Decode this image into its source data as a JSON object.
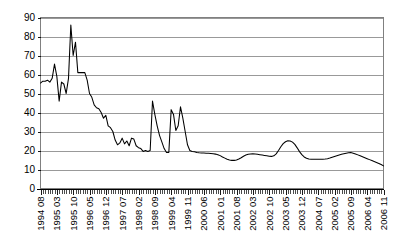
{
  "chart_data": {
    "type": "line",
    "title": "",
    "subtitle": "",
    "xlabel": "",
    "ylabel": "",
    "ylim": [
      0,
      90
    ],
    "ytick_step": 10,
    "ytick_labels": [
      "0",
      "10",
      "20",
      "30",
      "40",
      "50",
      "60",
      "70",
      "80",
      "90"
    ],
    "grid": true,
    "grid_axis": "y",
    "legend": false,
    "legend_position": "none",
    "line_color": "#000000",
    "grid_color": "#808080",
    "background_color": "#FFFFFF",
    "x_tick_interval_months": 7,
    "x_axis_start": "1994 08",
    "x_axis_end": "2006 11",
    "xtick_labels": [
      "1994 08",
      "1995 03",
      "1995 10",
      "1996 05",
      "1996 12",
      "1997 07",
      "1998 02",
      "1998 09",
      "1999 04",
      "1999 11",
      "2000 06",
      "2001 01",
      "2001 08",
      "2002 03",
      "2002 10",
      "2003 05",
      "2003 12",
      "2004 07",
      "2005 02",
      "2005 09",
      "2006 04",
      "2006 11"
    ],
    "x": [
      "1994 08",
      "1994 09",
      "1994 10",
      "1994 11",
      "1994 12",
      "1995 01",
      "1995 02",
      "1995 03",
      "1995 04",
      "1995 05",
      "1995 06",
      "1995 07",
      "1995 08",
      "1995 09",
      "1995 10",
      "1995 11",
      "1995 12",
      "1996 01",
      "1996 02",
      "1996 03",
      "1996 04",
      "1996 05",
      "1996 06",
      "1996 07",
      "1996 08",
      "1996 09",
      "1996 10",
      "1996 11",
      "1996 12",
      "1997 01",
      "1997 02",
      "1997 03",
      "1997 04",
      "1997 05",
      "1997 06",
      "1997 07",
      "1997 08",
      "1997 09",
      "1997 10",
      "1997 11",
      "1997 12",
      "1998 01",
      "1998 02",
      "1998 03",
      "1998 04",
      "1998 05",
      "1998 06",
      "1998 07",
      "1998 08",
      "1998 09",
      "1998 10",
      "1998 11",
      "1998 12",
      "1999 01",
      "1999 02",
      "1999 03",
      "1999 04",
      "1999 05",
      "1999 06",
      "1999 07",
      "1999 08",
      "1999 09",
      "1999 10",
      "1999 11",
      "1999 12",
      "2000 01",
      "2000 02",
      "2000 03",
      "2000 04",
      "2000 05",
      "2000 06",
      "2000 07",
      "2000 08",
      "2000 09",
      "2000 10",
      "2000 11",
      "2000 12",
      "2001 01",
      "2001 02",
      "2001 03",
      "2001 04",
      "2001 05",
      "2001 06",
      "2001 07",
      "2001 08",
      "2001 09",
      "2001 10",
      "2001 11",
      "2001 12",
      "2002 01",
      "2002 02",
      "2002 03",
      "2002 04",
      "2002 05",
      "2002 06",
      "2002 07",
      "2002 08",
      "2002 09",
      "2002 10",
      "2002 11",
      "2002 12",
      "2003 01",
      "2003 02",
      "2003 03",
      "2003 04",
      "2003 05",
      "2003 06",
      "2003 07",
      "2003 08",
      "2003 09",
      "2003 10",
      "2003 11",
      "2003 12",
      "2004 01",
      "2004 02",
      "2004 03",
      "2004 04",
      "2004 05",
      "2004 06",
      "2004 07",
      "2004 08",
      "2004 09",
      "2004 10",
      "2004 11",
      "2004 12",
      "2005 01",
      "2005 02",
      "2005 03",
      "2005 04",
      "2005 05",
      "2005 06",
      "2005 07",
      "2005 08",
      "2005 09",
      "2005 10",
      "2005 11",
      "2005 12",
      "2006 01",
      "2006 02",
      "2006 03",
      "2006 04",
      "2006 05",
      "2006 06",
      "2006 07",
      "2006 08",
      "2006 09",
      "2006 10",
      "2006 11"
    ],
    "values": [
      55.5,
      56.5,
      56.5,
      57.0,
      56.0,
      58.0,
      65.5,
      59.0,
      46.0,
      56.0,
      55.0,
      50.0,
      58.0,
      86.0,
      70.0,
      77.0,
      61.0,
      61.0,
      61.0,
      61.0,
      57.0,
      50.0,
      48.0,
      44.0,
      42.5,
      42.0,
      40.0,
      37.0,
      38.5,
      33.0,
      32.0,
      30.0,
      25.5,
      23.0,
      24.0,
      26.5,
      23.5,
      25.0,
      22.5,
      26.5,
      26.0,
      22.5,
      21.5,
      21.0,
      19.5,
      20.0,
      19.5,
      20.0,
      46.0,
      39.0,
      33.0,
      28.0,
      24.5,
      21.0,
      19.0,
      19.0,
      41.5,
      39.0,
      30.5,
      33.0,
      43.0,
      37.0,
      30.0,
      23.0,
      20.0,
      19.5,
      19.3,
      19.0,
      18.8,
      18.7,
      18.7,
      18.6,
      18.5,
      18.4,
      18.3,
      18.1,
      17.8,
      17.3,
      16.6,
      16.0,
      15.4,
      15.0,
      14.8,
      14.8,
      15.0,
      15.5,
      16.2,
      17.0,
      17.6,
      18.0,
      18.2,
      18.3,
      18.2,
      18.0,
      17.8,
      17.6,
      17.4,
      17.2,
      17.0,
      16.9,
      17.2,
      18.2,
      20.0,
      22.0,
      23.6,
      24.6,
      25.1,
      25.0,
      24.4,
      23.2,
      21.4,
      19.4,
      17.8,
      16.6,
      15.9,
      15.5,
      15.4,
      15.4,
      15.4,
      15.4,
      15.4,
      15.4,
      15.5,
      15.7,
      16.0,
      16.4,
      16.8,
      17.2,
      17.6,
      18.0,
      18.3,
      18.6,
      18.8,
      18.9,
      18.6,
      18.2,
      17.7,
      17.2,
      16.7,
      16.2,
      15.7,
      15.2,
      14.7,
      14.2,
      13.7,
      13.2,
      12.6,
      11.9
    ]
  }
}
